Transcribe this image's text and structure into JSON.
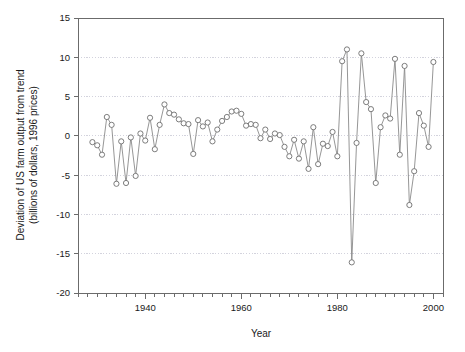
{
  "chart_data": {
    "type": "line",
    "title": "",
    "xlabel": "Year",
    "ylabel": "Deviation of US farm output from trend (billions of dollars, 1996 prices)",
    "ylabel_line1": "Deviation of US farm output from trend",
    "ylabel_line2": "(billions of dollars, 1996 prices)",
    "xlim": [
      1926,
      2002
    ],
    "ylim": [
      -20,
      15
    ],
    "yticks": [
      15,
      10,
      5,
      0,
      -5,
      -10,
      -15,
      -20
    ],
    "ytick_labels": [
      "15",
      "10",
      "5",
      "0",
      "-5",
      "-10",
      "-15",
      "-20"
    ],
    "xticks": [
      1940,
      1960,
      1980,
      2000
    ],
    "xtick_labels": [
      "1940",
      "1960",
      "1980",
      "2000"
    ],
    "x_minor_tick_step": 2,
    "grid": true,
    "grid_axis": "y",
    "legend": "none",
    "marker": "open-circle",
    "line_color": "#8a8a8a",
    "marker_fill": "#ffffff",
    "marker_edge_color": "#6e6e6e",
    "grid_color": "#c8c8d4",
    "axis_color": "#6b6b6b",
    "background": "#ffffff",
    "x": [
      1929,
      1930,
      1931,
      1932,
      1933,
      1934,
      1935,
      1936,
      1937,
      1938,
      1939,
      1940,
      1941,
      1942,
      1943,
      1944,
      1945,
      1946,
      1947,
      1948,
      1949,
      1950,
      1951,
      1952,
      1953,
      1954,
      1955,
      1956,
      1957,
      1958,
      1959,
      1960,
      1961,
      1962,
      1963,
      1964,
      1965,
      1966,
      1967,
      1968,
      1969,
      1970,
      1971,
      1972,
      1973,
      1974,
      1975,
      1976,
      1977,
      1978,
      1979,
      1980,
      1981,
      1982,
      1983,
      1984,
      1985,
      1986,
      1987,
      1988,
      1989,
      1990,
      1991,
      1992,
      1993,
      1994,
      1995,
      1996,
      1997,
      1998,
      1999,
      2000
    ],
    "y": [
      -0.8,
      -1.2,
      -2.4,
      2.4,
      1.4,
      -6.1,
      -0.7,
      -6.0,
      -0.2,
      -5.1,
      0.3,
      -0.6,
      2.3,
      -1.7,
      1.4,
      4.0,
      2.9,
      2.7,
      2.1,
      1.6,
      1.5,
      -2.3,
      2.0,
      1.2,
      1.7,
      -0.7,
      0.8,
      1.9,
      2.4,
      3.1,
      3.2,
      2.8,
      1.3,
      1.5,
      1.4,
      -0.3,
      0.8,
      -0.4,
      0.3,
      0.1,
      -1.4,
      -2.6,
      -0.5,
      -2.9,
      -0.7,
      -4.2,
      1.1,
      -3.6,
      -1.0,
      -1.3,
      0.5,
      -2.6,
      9.5,
      11.0,
      -16.1,
      -0.9,
      10.5,
      4.3,
      3.4,
      -6.0,
      1.1,
      2.6,
      2.2,
      9.8,
      -2.4,
      8.9,
      -8.8,
      -4.5,
      2.9,
      1.3,
      -1.4,
      9.4
    ]
  }
}
